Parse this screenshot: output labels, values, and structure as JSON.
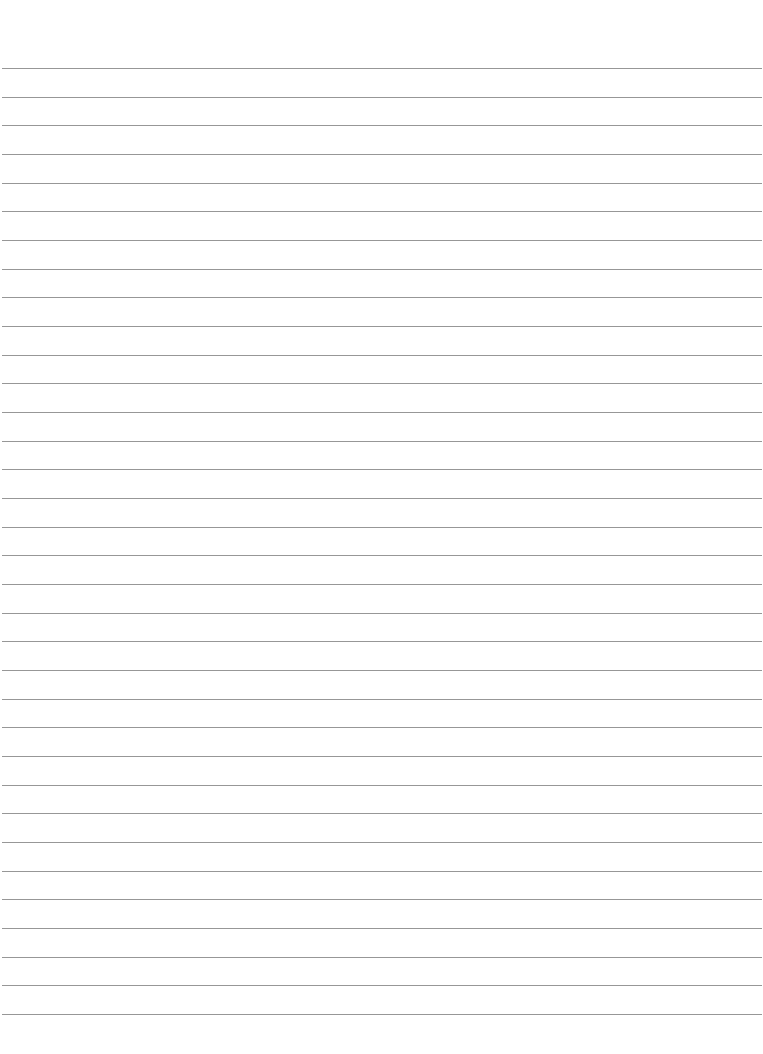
{
  "page": {
    "type": "lined-paper",
    "background_color": "#ffffff",
    "rule_color": "#8c8c8c",
    "rule_count": 34,
    "first_rule_y": 68,
    "last_rule_y": 1014,
    "rule_spacing": 28.67,
    "rule_left": 2,
    "rule_right_margin": 1
  }
}
